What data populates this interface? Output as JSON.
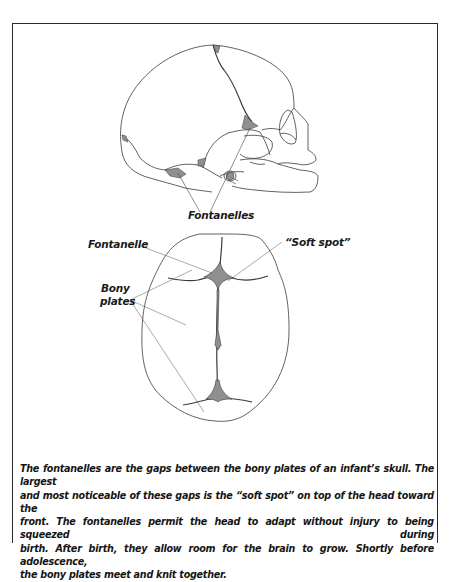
{
  "figure": {
    "side_view_label": "Fontanelles",
    "top_view_labels": {
      "fontanelle": "Fontanelle",
      "soft_spot": "“Soft spot”",
      "bony_plates_line1": "Bony",
      "bony_plates_line2": "plates"
    },
    "colors": {
      "outline": "#3a3a3a",
      "fontanelle_fill": "#8f8f8f",
      "frame": "#2a2a2a"
    }
  },
  "caption": {
    "lines": [
      "The fontanelles are the gaps between the bony plates of an infant’s skull. The largest",
      "and most noticeable of these gaps is the “soft spot” on top of the head toward the",
      "front. The fontanelles permit the head to adapt without injury to being squeezed during",
      "birth. After birth, they allow room for the brain to grow. Shortly before adolescence,",
      "the bony plates meet and knit together."
    ]
  }
}
